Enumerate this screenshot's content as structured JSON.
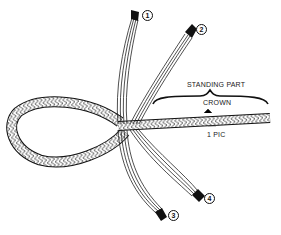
{
  "diagram": {
    "labels": {
      "standing_part": "STANDING PART",
      "crown": "CROWN",
      "pic": "1 PIC"
    },
    "strands": [
      {
        "id": "1",
        "label": "1"
      },
      {
        "id": "2",
        "label": "2"
      },
      {
        "id": "3",
        "label": "3"
      },
      {
        "id": "4",
        "label": "4"
      }
    ],
    "colors": {
      "ink": "#111111",
      "background": "#ffffff"
    }
  }
}
